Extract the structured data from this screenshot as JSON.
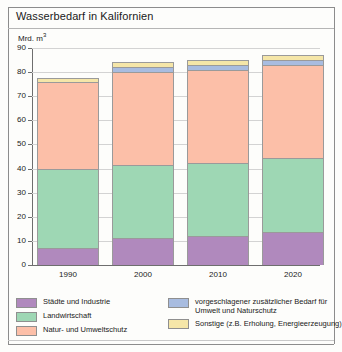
{
  "title": "Wasserbedarf in Kalifornien",
  "unit_label": "Mrd. m",
  "unit_exponent": "3",
  "chart_data": {
    "type": "bar",
    "title": "Wasserbedarf in Kalifornien",
    "subtitle": "",
    "xlabel": "",
    "ylabel": "Mrd. m³",
    "ylim": [
      0,
      90
    ],
    "yticks": [
      0,
      10,
      20,
      30,
      40,
      50,
      60,
      70,
      80,
      90
    ],
    "ytick_labels": [
      "0",
      "10",
      "20",
      "30",
      "40",
      "50",
      "60",
      "70",
      "80",
      "90"
    ],
    "grid": true,
    "stacked": true,
    "legend_position": "below",
    "categories": [
      "1990",
      "2000",
      "2010",
      "2020"
    ],
    "series": [
      {
        "name": "Städte und Industrie",
        "color": "#b089bd",
        "values": [
          7,
          11,
          12,
          13.5
        ]
      },
      {
        "name": "Landwirtschaft",
        "color": "#9ed7b4",
        "values": [
          33,
          30.5,
          30.5,
          31
        ]
      },
      {
        "name": "Natur- und Umweltschutz",
        "color": "#fcbfa8",
        "values": [
          36,
          38.5,
          38.5,
          38.5
        ]
      },
      {
        "name": "vorgeschlagener zusätzlicher Bedarf für Umwelt und Naturschutz",
        "color": "#a8bce0",
        "values": [
          0,
          2,
          2,
          2
        ]
      },
      {
        "name": "Sonstige (z.B. Erholung, Energieerzeugung)",
        "color": "#f5e6a8",
        "values": [
          1.5,
          2,
          2,
          2
        ]
      }
    ],
    "totals": [
      77.5,
      84,
      85,
      87
    ]
  },
  "legend": {
    "left_items": [
      {
        "label": "Städte und Industrie",
        "color": "#b089bd"
      },
      {
        "label": "Landwirtschaft",
        "color": "#9ed7b4"
      },
      {
        "label": "Natur- und Umweltschutz",
        "color": "#fcbfa8"
      }
    ],
    "right_items": [
      {
        "label": "vorgeschlagener zusätzlicher Bedarf für\nUmwelt und Naturschutz",
        "color": "#a8bce0"
      },
      {
        "label": "Sonstige (z.B. Erholung, Energieerzeugung)",
        "color": "#f5e6a8"
      }
    ]
  }
}
